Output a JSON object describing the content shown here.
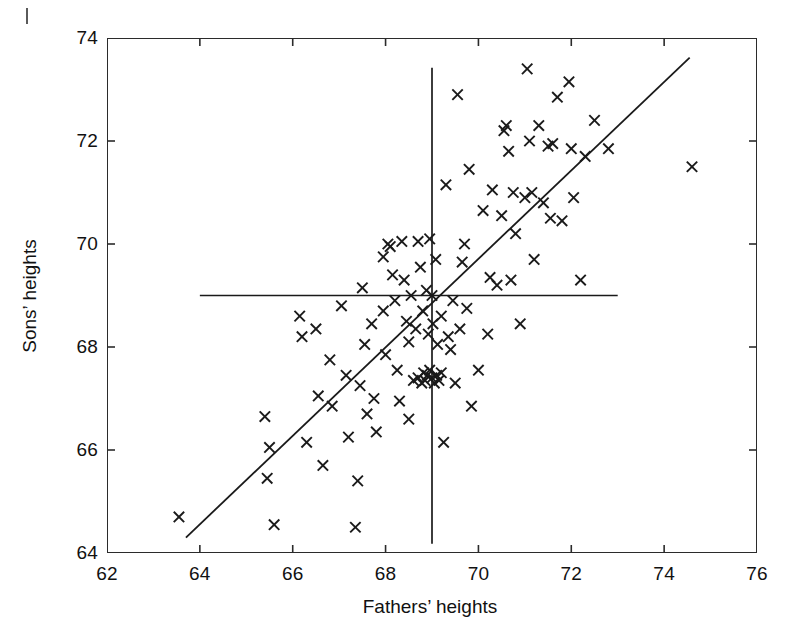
{
  "chart_data": {
    "type": "scatter",
    "title": "",
    "xlabel": "Fathers’ heights",
    "ylabel": "Sons’ heights",
    "xlim": [
      62,
      76
    ],
    "ylim": [
      64,
      74
    ],
    "xticks": [
      62,
      64,
      66,
      68,
      70,
      72,
      74,
      76
    ],
    "yticks": [
      64,
      66,
      68,
      70,
      72,
      74
    ],
    "xticklabels": [
      "62",
      "64",
      "66",
      "68",
      "70",
      "72",
      "74",
      "76"
    ],
    "yticklabels": [
      "64",
      "66",
      "68",
      "70",
      "72",
      "74"
    ],
    "grid": false,
    "legend": null,
    "marker": "x",
    "marker_color": "#1a1a1a",
    "line_color": "#1a1a1a",
    "background_color": "#ffffff",
    "points": [
      [
        63.55,
        64.7
      ],
      [
        65.4,
        66.65
      ],
      [
        65.45,
        65.45
      ],
      [
        65.5,
        66.05
      ],
      [
        65.6,
        64.55
      ],
      [
        66.15,
        68.6
      ],
      [
        66.2,
        68.2
      ],
      [
        66.3,
        66.15
      ],
      [
        66.5,
        68.35
      ],
      [
        66.55,
        67.05
      ],
      [
        66.65,
        65.7
      ],
      [
        66.8,
        67.75
      ],
      [
        66.85,
        66.85
      ],
      [
        67.05,
        68.8
      ],
      [
        67.15,
        67.45
      ],
      [
        67.2,
        66.25
      ],
      [
        67.35,
        64.5
      ],
      [
        67.4,
        65.4
      ],
      [
        67.45,
        67.25
      ],
      [
        67.5,
        69.15
      ],
      [
        67.55,
        68.05
      ],
      [
        67.6,
        66.7
      ],
      [
        67.7,
        68.45
      ],
      [
        67.75,
        67.0
      ],
      [
        67.8,
        66.35
      ],
      [
        67.95,
        69.75
      ],
      [
        67.95,
        68.7
      ],
      [
        68.0,
        67.85
      ],
      [
        68.05,
        70.0
      ],
      [
        68.1,
        69.95
      ],
      [
        68.15,
        69.4
      ],
      [
        68.2,
        68.9
      ],
      [
        68.25,
        67.55
      ],
      [
        68.3,
        66.95
      ],
      [
        68.35,
        70.05
      ],
      [
        68.4,
        69.3
      ],
      [
        68.45,
        68.5
      ],
      [
        68.5,
        68.1
      ],
      [
        68.5,
        66.6
      ],
      [
        68.55,
        69.0
      ],
      [
        68.6,
        67.35
      ],
      [
        68.65,
        68.35
      ],
      [
        68.7,
        70.05
      ],
      [
        68.7,
        67.4
      ],
      [
        68.75,
        69.55
      ],
      [
        68.78,
        67.3
      ],
      [
        68.8,
        68.7
      ],
      [
        68.82,
        67.5
      ],
      [
        68.85,
        67.35
      ],
      [
        68.88,
        69.1
      ],
      [
        68.9,
        67.45
      ],
      [
        68.92,
        68.25
      ],
      [
        68.95,
        70.1
      ],
      [
        68.95,
        67.55
      ],
      [
        69.0,
        69.0
      ],
      [
        69.0,
        67.4
      ],
      [
        69.02,
        68.45
      ],
      [
        69.05,
        67.3
      ],
      [
        69.08,
        69.7
      ],
      [
        69.1,
        67.45
      ],
      [
        69.12,
        68.05
      ],
      [
        69.15,
        67.35
      ],
      [
        69.2,
        68.6
      ],
      [
        69.2,
        67.5
      ],
      [
        69.25,
        66.15
      ],
      [
        69.3,
        71.15
      ],
      [
        69.35,
        68.2
      ],
      [
        69.4,
        67.95
      ],
      [
        69.45,
        68.9
      ],
      [
        69.5,
        67.3
      ],
      [
        69.55,
        72.9
      ],
      [
        69.6,
        68.35
      ],
      [
        69.65,
        69.65
      ],
      [
        69.7,
        70.0
      ],
      [
        69.75,
        68.75
      ],
      [
        69.8,
        71.45
      ],
      [
        69.85,
        66.85
      ],
      [
        70.0,
        67.55
      ],
      [
        70.1,
        70.65
      ],
      [
        70.2,
        68.25
      ],
      [
        70.25,
        69.35
      ],
      [
        70.3,
        71.05
      ],
      [
        70.4,
        69.2
      ],
      [
        70.5,
        70.55
      ],
      [
        70.55,
        72.2
      ],
      [
        70.6,
        72.3
      ],
      [
        70.65,
        71.8
      ],
      [
        70.7,
        69.3
      ],
      [
        70.75,
        71.0
      ],
      [
        70.8,
        70.2
      ],
      [
        70.9,
        68.45
      ],
      [
        71.0,
        70.9
      ],
      [
        71.05,
        73.4
      ],
      [
        71.1,
        72.0
      ],
      [
        71.15,
        71.0
      ],
      [
        71.2,
        69.7
      ],
      [
        71.3,
        72.3
      ],
      [
        71.4,
        70.8
      ],
      [
        71.5,
        71.9
      ],
      [
        71.55,
        70.5
      ],
      [
        71.6,
        71.95
      ],
      [
        71.7,
        72.85
      ],
      [
        71.8,
        70.45
      ],
      [
        71.95,
        73.15
      ],
      [
        72.0,
        71.85
      ],
      [
        72.05,
        70.9
      ],
      [
        72.2,
        69.3
      ],
      [
        72.3,
        71.7
      ],
      [
        72.5,
        72.4
      ],
      [
        72.8,
        71.85
      ],
      [
        74.6,
        71.5
      ]
    ],
    "reference_lines": [
      {
        "name": "mean-vertical-line",
        "orientation": "vertical",
        "x": 69.0,
        "y_from": 64.18,
        "y_to": 73.42
      },
      {
        "name": "mean-horizontal-line",
        "orientation": "horizontal",
        "y": 69.0,
        "x_from": 64.0,
        "x_to": 73.0
      }
    ],
    "fit_line": {
      "name": "regression-line",
      "x_from": 63.7,
      "y_from": 64.3,
      "x_to": 74.55,
      "y_to": 73.62,
      "slope": 0.86
    }
  }
}
